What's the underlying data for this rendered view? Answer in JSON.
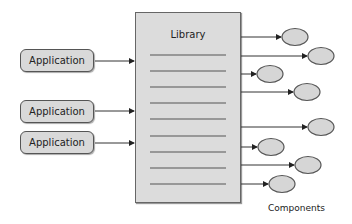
{
  "diagram": {
    "library": {
      "label": "Library",
      "slot_count": 9
    },
    "applications": [
      {
        "label": "Application"
      },
      {
        "label": "Application"
      },
      {
        "label": "Application"
      }
    ],
    "components": {
      "label": "Components",
      "count": 8
    },
    "colors": {
      "box_fill": "#dcdcdc",
      "stroke": "#444444",
      "background": "#ffffff"
    }
  }
}
